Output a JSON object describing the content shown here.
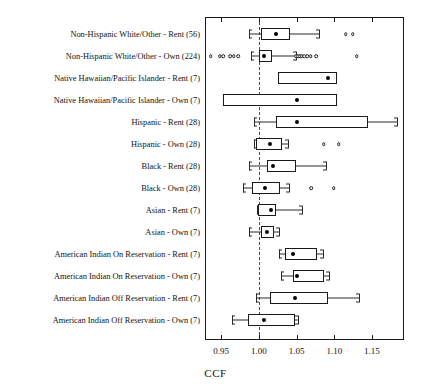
{
  "chart_data": {
    "type": "box",
    "title": "",
    "xlabel": "CCF",
    "ylabel": "",
    "xlim": [
      0.9285,
      1.1925
    ],
    "xticks": [
      0.95,
      1.0,
      1.05,
      1.1,
      1.15
    ],
    "xtick_labels": [
      "0.95",
      "1.00",
      "1.05",
      "1.10",
      "1.15"
    ],
    "grid": false,
    "legend": null,
    "reference_line": 1.0,
    "categories": [
      "Non-Hispanic White/Other - Rent (56)",
      "Non-Hispanic White/Other - Own (224)",
      "Native Hawaiian/Pacific Islander - Rent (7)",
      "Native Hawaiian/Pacific Islander - Own (7)",
      "Hispanic - Rent (28)",
      "Hispanic - Own (28)",
      "Black - Rent (28)",
      "Black - Own (28)",
      "Asian - Rent (7)",
      "Asian - Own (7)",
      "American Indian On Reservation - Rent (7)",
      "American Indian On Reservation - Own (7)",
      "American Indian Off Reservation - Rent (7)",
      "American Indian Off Reservation - Own (7)"
    ],
    "boxes": [
      {
        "label": "Non-Hispanic White/Other - Rent (56)",
        "n": 56,
        "whisker_low": 0.987,
        "q1": 1.0032,
        "median": 1.0232,
        "q3": 1.0414,
        "whisker_high": 1.08,
        "outliers": [
          1.115,
          1.1246
        ]
      },
      {
        "label": "Non-Hispanic White/Other - Own (224)",
        "n": 224,
        "whisker_low": 0.9895,
        "q1": 0.9996,
        "median": 1.0062,
        "q3": 1.0172,
        "whisker_high": 1.049,
        "outliers": [
          0.936,
          0.948,
          0.953,
          0.962,
          0.9665,
          0.9725,
          1.0495,
          1.052,
          1.0545,
          1.057,
          1.06,
          1.064,
          1.0688,
          1.076,
          1.13
        ]
      },
      {
        "label": "Native Hawaiian/Pacific Islander - Rent (7)",
        "n": 7,
        "whisker_low": 1.0258,
        "q1": 1.0258,
        "median": 1.092,
        "q3": 1.103,
        "whisker_high": 1.103,
        "outliers": []
      },
      {
        "label": "Native Hawaiian/Pacific Islander - Own (7)",
        "n": 7,
        "whisker_low": 0.952,
        "q1": 0.952,
        "median": 1.05,
        "q3": 1.103,
        "whisker_high": 1.103,
        "outliers": []
      },
      {
        "label": "Hispanic - Rent (28)",
        "n": 28,
        "whisker_low": 0.993,
        "q1": 1.0225,
        "median": 1.05,
        "q3": 1.145,
        "whisker_high": 1.1835,
        "outliers": []
      },
      {
        "label": "Hispanic - Own (28)",
        "n": 28,
        "whisker_low": 0.993,
        "q1": 0.9955,
        "median": 1.0145,
        "q3": 1.0305,
        "whisker_high": 1.0385,
        "outliers": [
          1.086,
          1.106
        ]
      },
      {
        "label": "Black - Rent (28)",
        "n": 28,
        "whisker_low": 0.987,
        "q1": 1.0105,
        "median": 1.0185,
        "q3": 1.0495,
        "whisker_high": 1.089,
        "outliers": []
      },
      {
        "label": "Black - Own (28)",
        "n": 28,
        "whisker_low": 0.979,
        "q1": 0.991,
        "median": 1.008,
        "q3": 1.028,
        "whisker_high": 1.04,
        "outliers": [
          1.069,
          1.099
        ]
      },
      {
        "label": "Asian - Rent (7)",
        "n": 7,
        "whisker_low": 0.997,
        "q1": 0.9985,
        "median": 1.016,
        "q3": 1.0225,
        "whisker_high": 1.057,
        "outliers": []
      },
      {
        "label": "Asian - Own (7)",
        "n": 7,
        "whisker_low": 0.9868,
        "q1": 1.0026,
        "median": 1.0105,
        "q3": 1.0198,
        "whisker_high": 1.0265,
        "outliers": []
      },
      {
        "label": "American Indian On Reservation - Rent (7)",
        "n": 7,
        "whisker_low": 1.0265,
        "q1": 1.0345,
        "median": 1.045,
        "q3": 1.077,
        "whisker_high": 1.0845,
        "outliers": []
      },
      {
        "label": "American Indian On Reservation - Own (7)",
        "n": 7,
        "whisker_low": 1.0292,
        "q1": 1.045,
        "median": 1.05,
        "q3": 1.086,
        "whisker_high": 1.0925,
        "outliers": []
      },
      {
        "label": "American Indian Off Reservation - Rent (7)",
        "n": 7,
        "whisker_low": 0.9955,
        "q1": 1.015,
        "median": 1.0475,
        "q3": 1.0915,
        "whisker_high": 1.1325,
        "outliers": []
      },
      {
        "label": "American Indian Off Reservation - Own (7)",
        "n": 7,
        "whisker_low": 0.964,
        "q1": 0.986,
        "median": 1.0065,
        "q3": 1.0475,
        "whisker_high": 1.0525,
        "outliers": []
      }
    ]
  }
}
